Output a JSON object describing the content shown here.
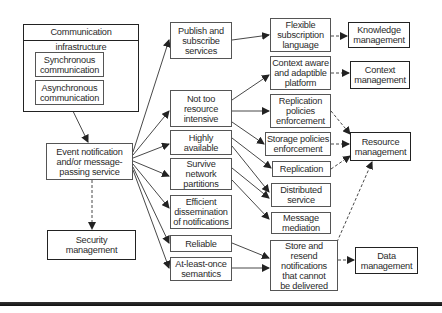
{
  "diagram": {
    "infrastructure": {
      "title": "Communication infrastructure",
      "items": [
        "Synchronous\ncommunication",
        "Asynchronous\ncommunication"
      ]
    },
    "event_service": "Event notification\nand/or message-\npassing service",
    "security": "Security\nmanagement",
    "properties": [
      "Publish and\nsubscribe\nservices",
      "Not too\nresource\nintensive",
      "Highly\navailable",
      "Survive\nnetwork\npartitions",
      "Efficient\ndissemination\nof notifications",
      "Reliable",
      "At-least-once\nsemantics"
    ],
    "mechanisms": [
      "Flexible\nsubscription\nlanguage",
      "Context aware\nand adaptible\nplatform",
      "Replication\npolicies\nenforcement",
      "Storage policies\nenforcement",
      "Replication",
      "Distributed\nservice",
      "Message\nmediation",
      "Store and\nresend\nnotifications\nthat cannot\nbe delivered"
    ],
    "management": {
      "knowledge": "Knowledge\nmanagement",
      "context": "Context\nmanagement",
      "resource": "Resource\nmanagement",
      "data": "Data\nmanagement"
    },
    "colors": {
      "line": "#333333",
      "border": "#222222",
      "background": "#ffffff"
    }
  }
}
